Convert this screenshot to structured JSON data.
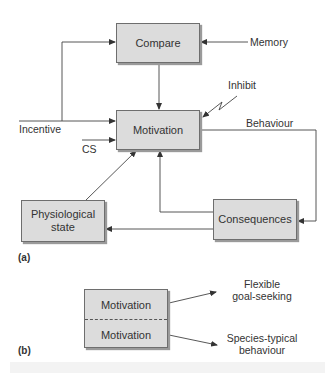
{
  "diagram": {
    "panel_a": {
      "label": "(a)",
      "nodes": {
        "compare": "Compare",
        "motivation": "Motivation",
        "physiological_state": "Physiological state",
        "consequences": "Consequences"
      },
      "inputs": {
        "memory": "Memory",
        "incentive": "Incentive",
        "cs": "CS",
        "inhibit": "Inhibit"
      },
      "edges": {
        "behaviour": "Behaviour"
      }
    },
    "panel_b": {
      "label": "(b)",
      "top_box": "Motivation",
      "bottom_box": "Motivation",
      "top_output_line1": "Flexible",
      "top_output_line2": "goal-seeking",
      "bottom_output_line1": "Species-typical",
      "bottom_output_line2": "behaviour"
    }
  },
  "colors": {
    "box_fill": "#dcdcdc",
    "box_border": "#6e6e6e",
    "line": "#444444",
    "text": "#333333"
  }
}
